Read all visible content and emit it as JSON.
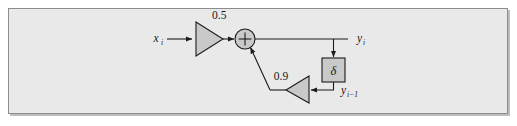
{
  "figure": {
    "kind": "signal-flow-block-diagram",
    "panel": {
      "background_color": "#e9e9e9",
      "border_color": "#8d8d8d",
      "shadow_color": "#bdbdbd"
    },
    "ink_color": "#1a1a1a",
    "block_fill_color": "#c9c9c9"
  },
  "labels": {
    "input": "x",
    "input_subscript": "i",
    "output": "y",
    "output_subscript": "i",
    "delayed_output": "y",
    "delayed_output_subscript": "i−1",
    "forward_gain": "0.5",
    "feedback_gain": "0.9",
    "delay_symbol": "δ",
    "sum_symbol": "+"
  },
  "blocks": [
    {
      "id": "forward-gain",
      "type": "triangle-gain",
      "label": "0.5",
      "orientation": "right"
    },
    {
      "id": "summing-junction",
      "type": "circle-adder",
      "label": "+"
    },
    {
      "id": "delay-element",
      "type": "rect-block",
      "label": "δ"
    },
    {
      "id": "feedback-gain",
      "type": "triangle-gain",
      "label": "0.9",
      "orientation": "left"
    }
  ],
  "signals": [
    {
      "id": "input-signal",
      "label": "x_i"
    },
    {
      "id": "output-signal",
      "label": "y_i"
    },
    {
      "id": "delayed-signal",
      "label": "y_i−1"
    }
  ]
}
